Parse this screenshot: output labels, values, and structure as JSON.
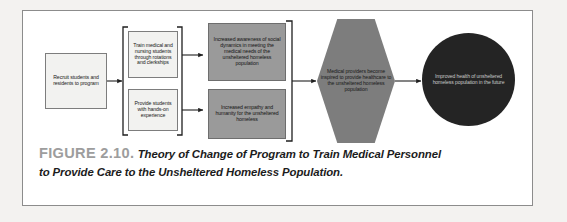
{
  "figure": {
    "label": "FIGURE 2.10.",
    "caption_line1": "Theory of Change of Program to Train Medical Personnel",
    "caption_line2": "to Provide Care to the Unsheltered Homeless Population."
  },
  "diagram": {
    "type": "flow-diagram",
    "title": "Theory of Change of Program to Train Medical Personnel to Provide Care to the Unsheltered Homeless Population",
    "nodes": {
      "input": {
        "text": "Recruit students and residents to program",
        "shape": "rectangle",
        "fill": "#f2f2f0"
      },
      "activity_1": {
        "text": "Train medical and nursing students through rotations and clerkships",
        "shape": "rectangle",
        "fill": "#f2f2f0"
      },
      "activity_2": {
        "text": "Provide students with hands-on experience",
        "shape": "rectangle",
        "fill": "#f2f2f0"
      },
      "outcome_1": {
        "text": "Increased awareness of social dynamics in meeting the medical needs of the unsheltered homeless population",
        "shape": "rectangle",
        "fill": "#9a9a9a"
      },
      "outcome_2": {
        "text": "Increased empathy and humanity for the unsheltered homeless",
        "shape": "rectangle",
        "fill": "#9a9a9a"
      },
      "impact": {
        "text": "Medical providers become inspired to provide healthcare to the unsheltered homeless population",
        "shape": "hexagon",
        "fill": "#7d7d7d"
      },
      "goal": {
        "text": "Improved health of unsheltered homeless population in the future",
        "shape": "circle",
        "fill": "#242424"
      }
    },
    "colors": {
      "frame_border": "#8c8c8c",
      "page_background": "#f3f2f0",
      "card_background": "#ffffff",
      "connector": "#1f1f1f",
      "figure_label": "#9d9d9d"
    }
  }
}
